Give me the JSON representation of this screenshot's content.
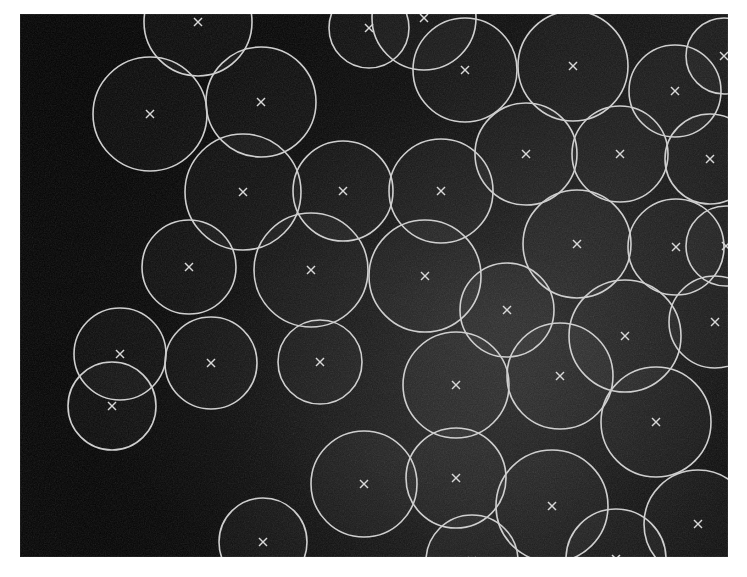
{
  "figure": {
    "caption": "",
    "image_kind": "grayscale-micrograph",
    "background_color": "#ffffff",
    "plate_color": "#050505",
    "overlay_stroke_color": "#cfcfcf",
    "center_marker_color": "#d8d8d8",
    "center_marker_glyph": "x",
    "plate": {
      "x": 20,
      "y": 14,
      "width": 708,
      "height": 543
    },
    "detected_count": 38
  },
  "chart_data": {
    "type": "scatter",
    "subtitle": "",
    "xlabel": "",
    "ylabel": "",
    "xlim": [
      0,
      708
    ],
    "ylim": [
      0,
      543
    ],
    "grid": false,
    "legend": [],
    "annotations": [],
    "marker": "x",
    "units": "pixels",
    "columns": [
      "cx",
      "cy",
      "r"
    ],
    "circles": [
      {
        "id": 1,
        "cx": 178,
        "cy": 8,
        "r": 54,
        "shade": 0.03
      },
      {
        "id": 2,
        "cx": 404,
        "cy": 4,
        "r": 52,
        "shade": 0.026
      },
      {
        "id": 3,
        "cx": 130,
        "cy": 100,
        "r": 57,
        "shade": 0.06
      },
      {
        "id": 4,
        "cx": 241,
        "cy": 88,
        "r": 55,
        "shade": 0.034
      },
      {
        "id": 5,
        "cx": 349,
        "cy": 14,
        "r": 40,
        "shade": 0.022
      },
      {
        "id": 6,
        "cx": 445,
        "cy": 56,
        "r": 52,
        "shade": 0.04
      },
      {
        "id": 7,
        "cx": 553,
        "cy": 52,
        "r": 55,
        "shade": 0.038
      },
      {
        "id": 8,
        "cx": 655,
        "cy": 77,
        "r": 46,
        "shade": 0.024
      },
      {
        "id": 9,
        "cx": 223,
        "cy": 178,
        "r": 58,
        "shade": 0.046
      },
      {
        "id": 10,
        "cx": 323,
        "cy": 177,
        "r": 50,
        "shade": 0.042
      },
      {
        "id": 11,
        "cx": 421,
        "cy": 177,
        "r": 52,
        "shade": 0.04
      },
      {
        "id": 12,
        "cx": 506,
        "cy": 140,
        "r": 51,
        "shade": 0.046
      },
      {
        "id": 13,
        "cx": 600,
        "cy": 140,
        "r": 48,
        "shade": 0.032
      },
      {
        "id": 14,
        "cx": 690,
        "cy": 145,
        "r": 45,
        "shade": 0.022
      },
      {
        "id": 15,
        "cx": 169,
        "cy": 253,
        "r": 47,
        "shade": 0.044
      },
      {
        "id": 16,
        "cx": 291,
        "cy": 256,
        "r": 57,
        "shade": 0.048
      },
      {
        "id": 17,
        "cx": 405,
        "cy": 262,
        "r": 56,
        "shade": 0.05
      },
      {
        "id": 18,
        "cx": 557,
        "cy": 230,
        "r": 54,
        "shade": 0.046
      },
      {
        "id": 19,
        "cx": 656,
        "cy": 233,
        "r": 48,
        "shade": 0.04
      },
      {
        "id": 20,
        "cx": 487,
        "cy": 296,
        "r": 47,
        "shade": 0.042
      },
      {
        "id": 21,
        "cx": 605,
        "cy": 322,
        "r": 56,
        "shade": 0.05
      },
      {
        "id": 22,
        "cx": 695,
        "cy": 308,
        "r": 46,
        "shade": 0.03
      },
      {
        "id": 23,
        "cx": 100,
        "cy": 340,
        "r": 46,
        "shade": 0.034
      },
      {
        "id": 24,
        "cx": 191,
        "cy": 349,
        "r": 46,
        "shade": 0.028
      },
      {
        "id": 25,
        "cx": 436,
        "cy": 371,
        "r": 53,
        "shade": 0.048
      },
      {
        "id": 26,
        "cx": 540,
        "cy": 362,
        "r": 53,
        "shade": 0.048
      },
      {
        "id": 27,
        "cx": 636,
        "cy": 408,
        "r": 55,
        "shade": 0.036
      },
      {
        "id": 28,
        "cx": 436,
        "cy": 464,
        "r": 50,
        "shade": 0.046
      },
      {
        "id": 29,
        "cx": 344,
        "cy": 470,
        "r": 53,
        "shade": 0.036
      },
      {
        "id": 30,
        "cx": 532,
        "cy": 492,
        "r": 56,
        "shade": 0.044
      },
      {
        "id": 31,
        "cx": 678,
        "cy": 510,
        "r": 54,
        "shade": 0.026
      },
      {
        "id": 32,
        "cx": 596,
        "cy": 545,
        "r": 50,
        "shade": 0.034
      },
      {
        "id": 33,
        "cx": 452,
        "cy": 547,
        "r": 46,
        "shade": 0.036
      },
      {
        "id": 34,
        "cx": 243,
        "cy": 528,
        "r": 44,
        "shade": 0.022
      },
      {
        "id": 35,
        "cx": 92,
        "cy": 392,
        "r": 44,
        "shade": 0.02
      },
      {
        "id": 36,
        "cx": 704,
        "cy": 42,
        "r": 38,
        "shade": 0.02
      },
      {
        "id": 37,
        "cx": 300,
        "cy": 348,
        "r": 42,
        "shade": 0.026
      },
      {
        "id": 38,
        "cx": 706,
        "cy": 232,
        "r": 40,
        "shade": 0.026
      }
    ]
  }
}
